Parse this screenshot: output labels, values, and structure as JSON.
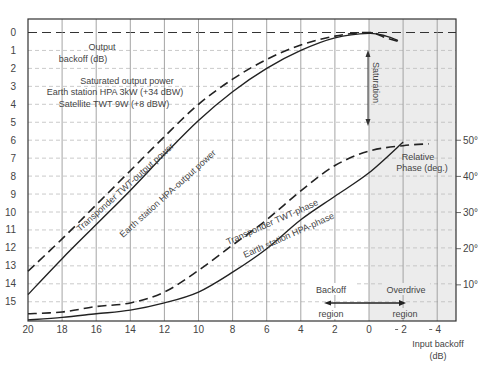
{
  "chart_data": {
    "type": "line",
    "title": "",
    "xlabel": "Input backoff (dB)",
    "xlabel_lines": [
      "Input backoff",
      "(dB)"
    ],
    "ylabel": "Output backoff (dB)",
    "ylabel_lines": [
      "Output",
      "backoff (dB)"
    ],
    "y2label": "Relative Phase (deg.)",
    "y2label_lines": [
      "Relative",
      "Phase (deg.)"
    ],
    "xlim": [
      20,
      -5.2
    ],
    "ylim": [
      0,
      16.2
    ],
    "y2lim": [
      0,
      45
    ],
    "x_ticks": [
      20,
      18,
      16,
      14,
      12,
      10,
      8,
      6,
      4,
      2,
      0,
      -2,
      -4
    ],
    "x_tick_labels": [
      "20",
      "18",
      "16",
      "14",
      "12",
      "10",
      "8",
      "6",
      "4",
      "2",
      "0",
      "2",
      "4"
    ],
    "y_ticks": [
      0,
      1,
      2,
      3,
      4,
      5,
      6,
      7,
      8,
      9,
      10,
      11,
      12,
      13,
      14,
      15
    ],
    "y_tick_labels": [
      "0",
      "1",
      "2",
      "3",
      "4",
      "5",
      "6",
      "7",
      "8",
      "9",
      "10",
      "11",
      "12",
      "13",
      "14",
      "15"
    ],
    "y2_ticks": [
      10,
      20,
      30,
      40,
      50
    ],
    "y2_tick_labels": [
      "10°",
      "20°",
      "30°",
      "40°",
      "50°"
    ],
    "grid": true,
    "shaded_region": {
      "name": "Overdrive region",
      "x_from": 0,
      "x_to": -5.2,
      "color": "#ececec"
    },
    "series": [
      {
        "name": "Transponder TWT-output power",
        "axis": "left",
        "style": "dashed",
        "x": [
          20,
          18,
          16,
          14,
          12,
          10,
          8,
          6,
          4,
          2,
          0,
          -1,
          -1.7
        ],
        "y": [
          13.3,
          11.5,
          9.6,
          7.7,
          5.8,
          4.0,
          2.6,
          1.5,
          0.7,
          0.2,
          0.0,
          0.3,
          0.5
        ]
      },
      {
        "name": "Earth station HPA-output power",
        "axis": "left",
        "style": "solid",
        "x": [
          20,
          18,
          16,
          14,
          12,
          10,
          8,
          6,
          4,
          2,
          0,
          -1,
          -1.7
        ],
        "y": [
          14.6,
          12.6,
          10.7,
          8.8,
          6.8,
          4.9,
          3.3,
          2.0,
          1.0,
          0.3,
          0.05,
          0.2,
          0.45
        ]
      },
      {
        "name": "Transponder TWT-phase",
        "axis": "right",
        "style": "dashed",
        "x": [
          20,
          18,
          16,
          14,
          12,
          10,
          8,
          6,
          4,
          2,
          0,
          -2,
          -3.5
        ],
        "y": [
          2,
          2.5,
          4,
          5,
          8,
          14,
          21,
          28,
          36,
          43,
          47,
          48.5,
          49
        ]
      },
      {
        "name": "Earth station HPA-phase",
        "axis": "right",
        "style": "solid",
        "x": [
          20,
          18,
          16,
          14,
          12,
          10,
          8,
          6,
          4,
          2,
          0,
          -2
        ],
        "y": [
          0.3,
          1,
          2,
          3,
          5,
          8,
          13.5,
          20,
          28,
          34.5,
          41,
          49.5
        ]
      }
    ],
    "annotations": {
      "saturated_title": "Saturated output power",
      "hpa_power": "Earth station HPA 3kW (+34 dBW)",
      "twt_power": "Satellite TWT 9W (+8 dBW)",
      "saturation": "Saturation",
      "backoff_line1": "Backoff",
      "backoff_line2": "region",
      "overdrive_line1": "Overdrive",
      "overdrive_line2": "region",
      "label_twt_power": "Transponder TWT-output power",
      "label_hpa_power": "Earth station HPA-output power",
      "label_twt_phase": "Transponder TWT-phase",
      "label_hpa_phase": "Earth station HPA-phase"
    }
  }
}
